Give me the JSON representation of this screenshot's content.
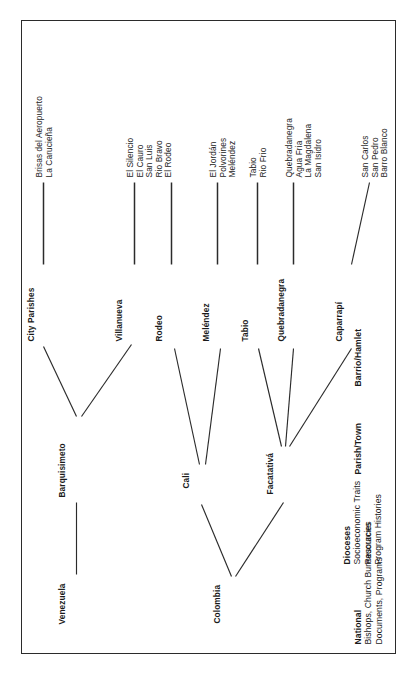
{
  "diagram": {
    "type": "tree",
    "orientation": "rotated-90-ccw",
    "frame_color": "#2b2b2b",
    "text_color": "#1a1a1a",
    "levels": [
      {
        "id": "national",
        "heading": "National",
        "sublines": [
          "Bishops, Church Bureaucracies",
          "Documents, Programs"
        ],
        "nodes": [
          "Venezuela",
          "Colombia"
        ]
      },
      {
        "id": "dioceses",
        "heading": "Dioceses",
        "sublines": [
          "Socioeconomic Traits",
          "Resources",
          "Program Histories"
        ],
        "nodes": [
          "Barquisimeto",
          "Cali",
          "Facatativá"
        ]
      },
      {
        "id": "parish-town",
        "heading": "Parish/Town",
        "sublines": [],
        "nodes": [
          "City Parishes",
          "Villanueva",
          "Rodeo",
          "Meléndez",
          "Tabio",
          "Quebradanegra",
          "Caparrapí"
        ]
      },
      {
        "id": "barrio-hamlet",
        "heading": "Barrio/Hamlet",
        "sublines": [],
        "nodes": []
      }
    ],
    "nodes": {
      "venezuela": "Venezuela",
      "colombia": "Colombia",
      "barquisimeto": "Barquisimeto",
      "cali": "Cali",
      "facatativa": "Facatativá",
      "city_parishes": "City Parishes",
      "villanueva": "Villanueva",
      "rodeo": "Rodeo",
      "melendez": "Meléndez",
      "tabio": "Tabio",
      "quebradanegra": "Quebradanegra",
      "caparrapi": "Caparrapí"
    },
    "hamlet_groups": {
      "city_parishes": [
        "Brisas del Aeropuerto",
        "La Carucieña"
      ],
      "villanueva": [
        "El Silencio",
        "El Cauro",
        "San Luis",
        "Rio Bravo"
      ],
      "rodeo": [
        "El Rodeo"
      ],
      "melendez": [
        "El Jordán",
        "Polvorines",
        "Meléndez"
      ],
      "tabio": [
        "Tabio",
        "Rio Frio"
      ],
      "quebradanegra": [
        "Quebradanegra",
        "Agua Fria",
        "La Magdalena",
        "San Isidro"
      ],
      "caparrapi": [
        "San Carlos",
        "San Pedro",
        "Barro Blanco"
      ]
    },
    "row_labels": {
      "national_heading": "National",
      "national_sub1": "Bishops, Church Bureaucracies",
      "national_sub2": "Documents, Programs",
      "dioceses_heading": "Dioceses",
      "dioceses_sub1": "Socioeconomic Traits",
      "dioceses_sub2": "Resources",
      "dioceses_sub3": "Program Histories",
      "parish_heading": "Parish/Town",
      "barrio_heading": "Barrio/Hamlet"
    }
  }
}
